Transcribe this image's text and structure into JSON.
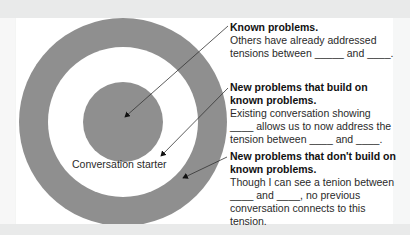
{
  "diagram": {
    "center_label": "Conversation starter",
    "colors": {
      "ring": "#8f8f8f",
      "background": "#ffffff",
      "frame": "#e9eaea"
    },
    "annotations": [
      {
        "title": "Known problems.",
        "body": "Others have already addressed tensions between _____ and ____."
      },
      {
        "title": "New problems that build on known problems.",
        "body": "Existing conversation showing ____ allows us to now address the tension between ____ and ____."
      },
      {
        "title": "New problems that don't build on known problems.",
        "body": "Though I can see a tenion between ____ and ____, no previous conversation connects to this tension."
      }
    ]
  }
}
